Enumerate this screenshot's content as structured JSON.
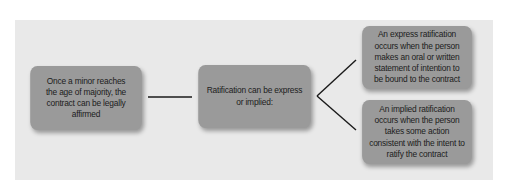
{
  "diagram": {
    "type": "flowchart",
    "colors": {
      "background": "#ffffff",
      "panel": "#e9e9e9",
      "box_fill": "#9a9a9a",
      "text": "#1c1c1c",
      "connector": "#1a1a1a"
    },
    "nodes": [
      {
        "id": "minor-majority",
        "text": "Once a minor reaches the age of majority, the contract can be legally affirmed"
      },
      {
        "id": "ratification",
        "text": "Ratification can be express or implied:"
      },
      {
        "id": "express",
        "text": "An express ratification occurs when the person makes an oral or written statement of intention to be bound to the contract"
      },
      {
        "id": "implied",
        "text": "An implied ratification occurs when the person takes some action consistent with the intent to ratify the contract"
      }
    ],
    "edges": [
      {
        "from": "minor-majority",
        "to": "ratification"
      },
      {
        "from": "ratification",
        "to": "express"
      },
      {
        "from": "ratification",
        "to": "implied"
      }
    ]
  }
}
